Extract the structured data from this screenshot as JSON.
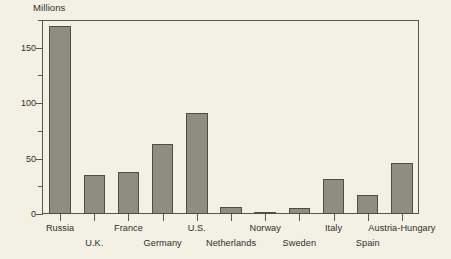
{
  "chart_data": {
    "type": "bar",
    "title": "Millions",
    "xlabel": "",
    "ylabel": "Millions",
    "ylim": [
      0,
      175
    ],
    "yticks": [
      0,
      50,
      100,
      150
    ],
    "ytick_labels": [
      "0",
      "50",
      "100",
      "150"
    ],
    "minor_tick_interval": 25,
    "grid": false,
    "legend": null,
    "categories": [
      "Russia",
      "U.K.",
      "France",
      "Germany",
      "U.S.",
      "Netherlands",
      "Norway",
      "Sweden",
      "Italy",
      "Spain",
      "Austria-Hungary"
    ],
    "values": [
      170,
      35,
      38,
      63,
      91,
      6,
      2,
      5,
      32,
      17,
      46
    ],
    "label_rows": [
      0,
      1,
      0,
      1,
      0,
      1,
      0,
      1,
      0,
      1,
      0
    ],
    "colors": {
      "background": "#f3f1e3",
      "bar_fill": "#8d8d82",
      "bar_stroke": "#4e4e45",
      "axis": "#56564c",
      "text": "#2e2e2a"
    }
  }
}
